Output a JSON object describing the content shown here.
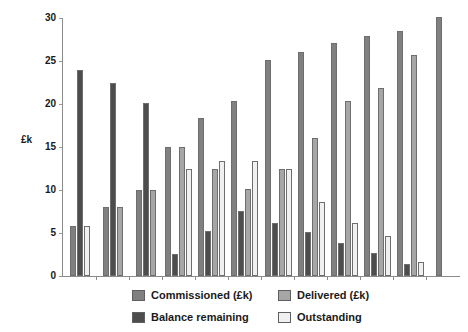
{
  "chart_data": {
    "type": "bar",
    "title": "",
    "subtitle": "",
    "xlabel": "",
    "ylabel": "£k",
    "ylim": [
      0,
      30
    ],
    "yticks": [
      0,
      5,
      10,
      15,
      20,
      25,
      30
    ],
    "ytick_labels": [
      "0",
      "5",
      "10",
      "15",
      "20",
      "25",
      "30"
    ],
    "grid": false,
    "legend_position": "bottom",
    "categories": [
      "1",
      "2",
      "3",
      "4",
      "5",
      "6",
      "7",
      "8",
      "9",
      "10",
      "11"
    ],
    "series": [
      {
        "name": "Commissioned (£k)",
        "color": "#808080",
        "values": [
          5.8,
          8.0,
          10.0,
          15.0,
          18.4,
          20.4,
          25.1,
          26.1,
          27.1,
          27.9,
          28.5
        ]
      },
      {
        "name": "Balance remaining",
        "color": "#4d4d4d",
        "values": [
          24.0,
          22.5,
          20.1,
          2.6,
          5.2,
          7.6,
          6.2,
          5.1,
          3.8,
          2.7,
          1.4
        ]
      },
      {
        "name": "Delivered (£k)",
        "color": "#a6a6a6",
        "values": [
          null,
          8.0,
          10.0,
          15.0,
          12.4,
          10.1,
          12.4,
          16.1,
          20.4,
          21.9,
          25.7
        ]
      },
      {
        "name": "Outstanding",
        "color": "#f0f0f0",
        "values": [
          5.8,
          null,
          null,
          12.4,
          13.4,
          13.4,
          12.4,
          8.6,
          6.2,
          4.7,
          1.6
        ]
      }
    ],
    "extra_group": {
      "label": "12",
      "series": "Commissioned (£k)",
      "value": 30.1
    }
  },
  "legend": {
    "items": [
      {
        "label": "Commissioned (£k)",
        "color": "#808080"
      },
      {
        "label": "Balance remaining",
        "color": "#4d4d4d"
      },
      {
        "label": "Delivered (£k)",
        "color": "#a6a6a6"
      },
      {
        "label": "Outstanding",
        "color": "#f0f0f0"
      }
    ]
  },
  "axes": {
    "y_axis_label": "£k"
  }
}
